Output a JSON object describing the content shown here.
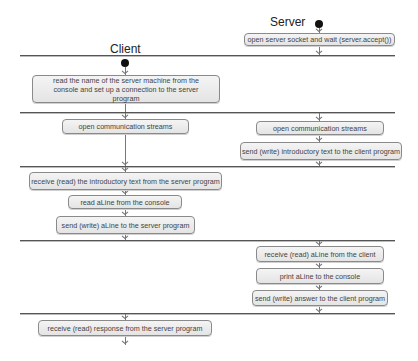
{
  "lanes": {
    "client_title": "Client",
    "server_title": "Server"
  },
  "server": {
    "open_socket": "open server socket and wait (server.accept())",
    "open_streams": "open communication streams",
    "send_intro": "send (write) introductory text to the client program",
    "receive_line": "receive (read)  aLine from the client",
    "print_line": "print aLine to the console",
    "send_answer": "send (write) answer to the client program"
  },
  "client": {
    "connect": "read the name of the server machine from the console and set up a connection to the server program",
    "open_streams": "open communication streams",
    "receive_intro": "receive (read) the introductory text from the server program",
    "read_line": "read aLine from the console",
    "send_line": "send (write) aLine to the server program",
    "receive_response": "receive (read) response from the server program"
  },
  "colors": {
    "box_fill": "#ececec",
    "box_border": "#8a8a8a",
    "separator": "#555555",
    "start_node": "#111111"
  }
}
